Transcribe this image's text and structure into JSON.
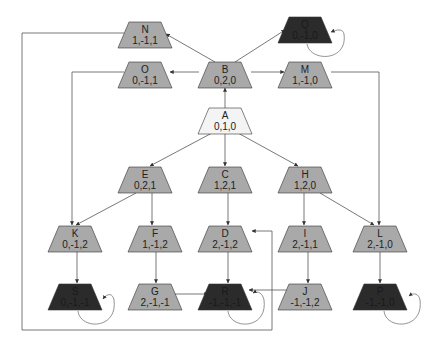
{
  "diagram": {
    "type": "state-transition-graph",
    "colors": {
      "start": "#f4f4f4",
      "normal": "#a9a9a9",
      "terminal": "#2b2b2b",
      "stroke": "#333333",
      "edge": "#555555"
    },
    "nodes": [
      {
        "id": "N",
        "label": "N",
        "value": "1,-1,1",
        "kind": "normal",
        "x": 145,
        "y": 22
      },
      {
        "id": "Q",
        "label": "Q",
        "value": "0,-1,0",
        "kind": "terminal",
        "x": 305,
        "y": 17
      },
      {
        "id": "O",
        "label": "O",
        "value": "0,-1,1",
        "kind": "normal",
        "x": 145,
        "y": 62
      },
      {
        "id": "B",
        "label": "B",
        "value": "0,2,0",
        "kind": "normal",
        "x": 225,
        "y": 62
      },
      {
        "id": "M",
        "label": "M",
        "value": "1,-1,0",
        "kind": "normal",
        "x": 305,
        "y": 62
      },
      {
        "id": "A",
        "label": "A",
        "value": "0,1,0",
        "kind": "start",
        "x": 225,
        "y": 108
      },
      {
        "id": "E",
        "label": "E",
        "value": "0,2,1",
        "kind": "normal",
        "x": 145,
        "y": 167
      },
      {
        "id": "C",
        "label": "C",
        "value": "1,2,1",
        "kind": "normal",
        "x": 225,
        "y": 167
      },
      {
        "id": "H",
        "label": "H",
        "value": "1,2,0",
        "kind": "normal",
        "x": 305,
        "y": 167
      },
      {
        "id": "K",
        "label": "K",
        "value": "0,-1,2",
        "kind": "normal",
        "x": 75,
        "y": 226
      },
      {
        "id": "F",
        "label": "F",
        "value": "1,-1,2",
        "kind": "normal",
        "x": 155,
        "y": 226
      },
      {
        "id": "D",
        "label": "D",
        "value": "2,-1,2",
        "kind": "normal",
        "x": 225,
        "y": 226
      },
      {
        "id": "I",
        "label": "I",
        "value": "2,-1,1",
        "kind": "normal",
        "x": 305,
        "y": 226
      },
      {
        "id": "L",
        "label": "L",
        "value": "2,-1,0",
        "kind": "normal",
        "x": 380,
        "y": 226
      },
      {
        "id": "S",
        "label": "S",
        "value": "0,-1,-1",
        "kind": "terminal",
        "x": 75,
        "y": 284
      },
      {
        "id": "G",
        "label": "G",
        "value": "2,-1,-1",
        "kind": "normal",
        "x": 155,
        "y": 284
      },
      {
        "id": "R",
        "label": "R",
        "value": "-1,-1,-1",
        "kind": "terminal",
        "x": 225,
        "y": 284
      },
      {
        "id": "J",
        "label": "J",
        "value": "-1,-1,2",
        "kind": "normal",
        "x": 305,
        "y": 284
      },
      {
        "id": "P",
        "label": "P",
        "value": "-1,-1,0",
        "kind": "terminal",
        "x": 380,
        "y": 284
      }
    ],
    "edges": [
      {
        "from": "A",
        "to": "B"
      },
      {
        "from": "A",
        "to": "E"
      },
      {
        "from": "A",
        "to": "C"
      },
      {
        "from": "A",
        "to": "H"
      },
      {
        "from": "B",
        "to": "N"
      },
      {
        "from": "B",
        "to": "O"
      },
      {
        "from": "B",
        "to": "Q"
      },
      {
        "from": "B",
        "to": "M"
      },
      {
        "from": "M",
        "to": "L"
      },
      {
        "from": "O",
        "to": "K"
      },
      {
        "from": "N",
        "to": "R"
      },
      {
        "from": "E",
        "to": "K"
      },
      {
        "from": "E",
        "to": "F"
      },
      {
        "from": "C",
        "to": "D"
      },
      {
        "from": "H",
        "to": "I"
      },
      {
        "from": "H",
        "to": "L"
      },
      {
        "from": "K",
        "to": "S"
      },
      {
        "from": "F",
        "to": "G"
      },
      {
        "from": "D",
        "to": "R"
      },
      {
        "from": "I",
        "to": "J"
      },
      {
        "from": "L",
        "to": "P"
      },
      {
        "from": "G",
        "to": "R"
      },
      {
        "from": "J",
        "to": "R"
      },
      {
        "from": "R",
        "to": "D"
      },
      {
        "from": "S",
        "to": "S"
      },
      {
        "from": "R",
        "to": "R"
      },
      {
        "from": "P",
        "to": "P"
      },
      {
        "from": "Q",
        "to": "Q"
      }
    ]
  }
}
